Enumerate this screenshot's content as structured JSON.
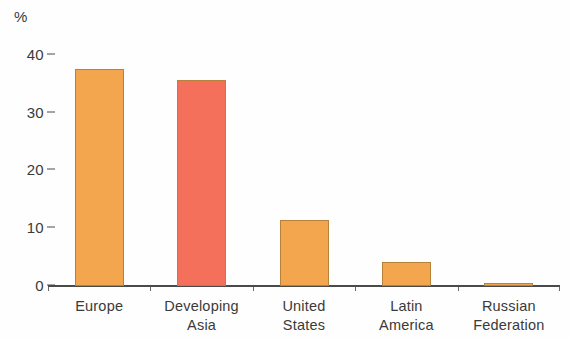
{
  "chart_data": {
    "type": "bar",
    "title": "",
    "subtitle": "",
    "xlabel": "",
    "ylabel": "%",
    "unit_label": "%",
    "categories": [
      "Europe",
      "Developing Asia",
      "United States",
      "Latin America",
      "Russian Federation"
    ],
    "category_lines": [
      [
        "Europe"
      ],
      [
        "Developing",
        "Asia"
      ],
      [
        "United",
        "States"
      ],
      [
        "Latin",
        "America"
      ],
      [
        "Russian",
        "Federation"
      ]
    ],
    "values": [
      37.5,
      35.7,
      11.5,
      4.2,
      0.5
    ],
    "bar_colors": [
      "#f3a64d",
      "#f4705a",
      "#f3a64d",
      "#f3a64d",
      "#f3a64d"
    ],
    "ylim": [
      0,
      41
    ],
    "ytick_values": [
      0,
      10,
      20,
      30,
      40
    ],
    "ytick_labels": [
      "0",
      "10",
      "20",
      "30",
      "40"
    ],
    "grid": false,
    "legend": null,
    "legend_position": "none",
    "annotations": []
  },
  "style": {
    "background": "#fefefe",
    "axis_color": "#4a4a4a",
    "text_color": "#3a3a3a",
    "orange": "#f3a64d",
    "red": "#f4705a",
    "bar_border": "#b9823a"
  }
}
